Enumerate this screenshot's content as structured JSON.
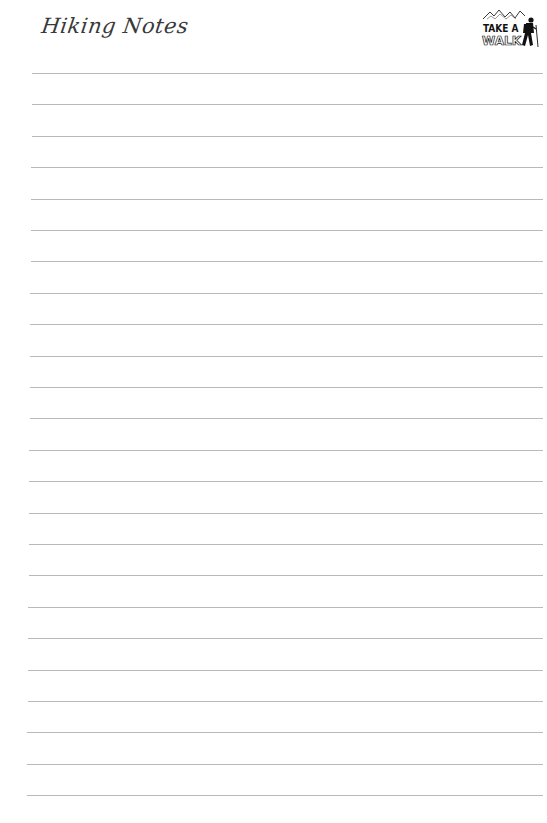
{
  "header": {
    "title": "Hiking Notes",
    "title_color": "#3a3a3a",
    "logo": {
      "icon": "take-a-walk-hiker-logo",
      "line1": "TAKE A",
      "line2": "WALK"
    }
  },
  "ruled_lines": {
    "count": 24,
    "color": "#b9b9b9",
    "first_y": 73,
    "spacing": 31.4,
    "left_x_top": 32,
    "left_x_bottom": 27,
    "right_x": 543
  }
}
